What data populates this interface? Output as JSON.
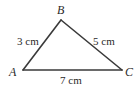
{
  "diagram": {
    "type": "triangle",
    "colors": {
      "stroke": "#3a3a3a",
      "text": "#2a2a2a",
      "background": "#ffffff"
    },
    "vertices": {
      "A": {
        "label": "A"
      },
      "B": {
        "label": "B"
      },
      "C": {
        "label": "C"
      }
    },
    "sides": {
      "AB": {
        "label": "3 cm"
      },
      "BC": {
        "label": "5 cm"
      },
      "AC": {
        "label": "7 cm"
      }
    }
  }
}
